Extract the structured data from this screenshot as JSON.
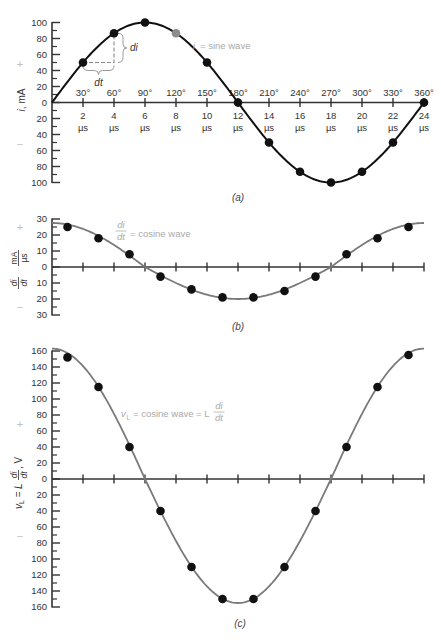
{
  "chart_data": [
    {
      "panel_id": "a",
      "type": "line",
      "title": "",
      "caption": "(a)",
      "xlabel": "",
      "ylabel": {
        "var": "i",
        "unit": ", mA"
      },
      "sign_plus": "+",
      "sign_minus": "−",
      "grid": false,
      "xlim": [
        0,
        24
      ],
      "ylim": [
        -100,
        100
      ],
      "x_unit": "µs",
      "x_tick_values": [
        2,
        4,
        6,
        8,
        10,
        12,
        14,
        16,
        18,
        20,
        22,
        24
      ],
      "x_tick_labels": [
        "2",
        "4",
        "6",
        "8",
        "10",
        "12",
        "14",
        "16",
        "18",
        "20",
        "22",
        "24"
      ],
      "x_tick_angles": [
        "30°",
        "60°",
        "90°",
        "120°",
        "150°",
        "180°",
        "210°",
        "240°",
        "270°",
        "300°",
        "330°",
        "360°"
      ],
      "y_tick_values": [
        100,
        80,
        60,
        40,
        20,
        0,
        -20,
        -40,
        -60,
        -80,
        -100
      ],
      "y_tick_labels": [
        "100",
        "80",
        "60",
        "40",
        "20",
        "0",
        "20",
        "40",
        "60",
        "80",
        "100"
      ],
      "curve_label": {
        "var": "i",
        "text": "= sine wave"
      },
      "curve": {
        "shape": "sine",
        "amplitude_pos": 100,
        "amplitude_neg": 100,
        "color": "#111111"
      },
      "series": [
        {
          "name": "i (mA)",
          "x": [
            2,
            4,
            6,
            8,
            10,
            12,
            14,
            16,
            18,
            20,
            22,
            24
          ],
          "y": [
            50,
            86.6,
            100,
            86.6,
            50,
            0,
            -50,
            -86.6,
            -100,
            -86.6,
            -50,
            0
          ]
        }
      ],
      "highlight_point": {
        "x": 8,
        "y": 86.6,
        "color": "#8c8c8c"
      },
      "construction": {
        "from": {
          "x": 2,
          "y": 50
        },
        "to": {
          "x": 4,
          "y": 86.6
        },
        "di_label": "di",
        "dt_label": "dt"
      }
    },
    {
      "panel_id": "b",
      "type": "line",
      "title": "",
      "caption": "(b)",
      "xlabel": "",
      "ylabel": {
        "numer": "di",
        "denom": "dt",
        "unit_numer": "mA",
        "unit_denom": "µs"
      },
      "sign_plus": "+",
      "sign_minus": "−",
      "grid": false,
      "xlim": [
        0,
        24
      ],
      "ylim": [
        -30,
        30
      ],
      "x_tick_values": [
        2,
        4,
        6,
        8,
        10,
        12,
        14,
        16,
        18,
        20,
        22,
        24
      ],
      "y_tick_values": [
        30,
        20,
        10,
        0,
        -10,
        -20,
        -30
      ],
      "y_tick_labels": [
        "30",
        "20",
        "10",
        "0",
        "10",
        "20",
        "30"
      ],
      "curve_label": {
        "numer": "di",
        "denom": "dt",
        "text": "= cosine wave"
      },
      "curve": {
        "shape": "cosine",
        "amplitude_pos": 27.5,
        "amplitude_neg": 20,
        "color": "#7a7a7a"
      },
      "series": [
        {
          "name": "di/dt (mA/µs)",
          "x": [
            1,
            3,
            5,
            7,
            9,
            11,
            13,
            15,
            17,
            19,
            21,
            23
          ],
          "y": [
            25,
            18,
            8,
            -6,
            -14,
            -19,
            -19,
            -15,
            -6,
            8,
            18,
            25
          ]
        }
      ]
    },
    {
      "panel_id": "c",
      "type": "line",
      "title": "",
      "caption": "(c)",
      "xlabel": "",
      "ylabel": {
        "var": "v",
        "sub": "L",
        "eq": " = L",
        "numer": "di",
        "denom": "dt",
        "unit": ", V"
      },
      "sign_plus": "+",
      "sign_minus": "−",
      "grid": false,
      "xlim": [
        0,
        24
      ],
      "ylim": [
        -160,
        160
      ],
      "x_tick_values": [
        2,
        4,
        6,
        8,
        10,
        12,
        14,
        16,
        18,
        20,
        22,
        24
      ],
      "y_tick_values": [
        160,
        140,
        120,
        100,
        80,
        60,
        40,
        20,
        0,
        -20,
        -40,
        -60,
        -80,
        -100,
        -120,
        -140,
        -160
      ],
      "y_tick_labels": [
        "160",
        "140",
        "120",
        "100",
        "80",
        "60",
        "40",
        "20",
        "0",
        "20",
        "40",
        "60",
        "80",
        "100",
        "120",
        "140",
        "160"
      ],
      "curve_label": {
        "var": "v",
        "sub": "L",
        "text": "= cosine wave = L",
        "numer": "di",
        "denom": "dt"
      },
      "curve": {
        "shape": "cosine",
        "amplitude_pos": 163,
        "amplitude_neg": 155,
        "color": "#7a7a7a"
      },
      "series": [
        {
          "name": "vL (V)",
          "x": [
            1,
            3,
            5,
            7,
            9,
            11,
            13,
            15,
            17,
            19,
            21,
            23
          ],
          "y": [
            152,
            115,
            40,
            -40,
            -110,
            -150,
            -150,
            -110,
            -40,
            40,
            115,
            155
          ]
        }
      ]
    }
  ]
}
